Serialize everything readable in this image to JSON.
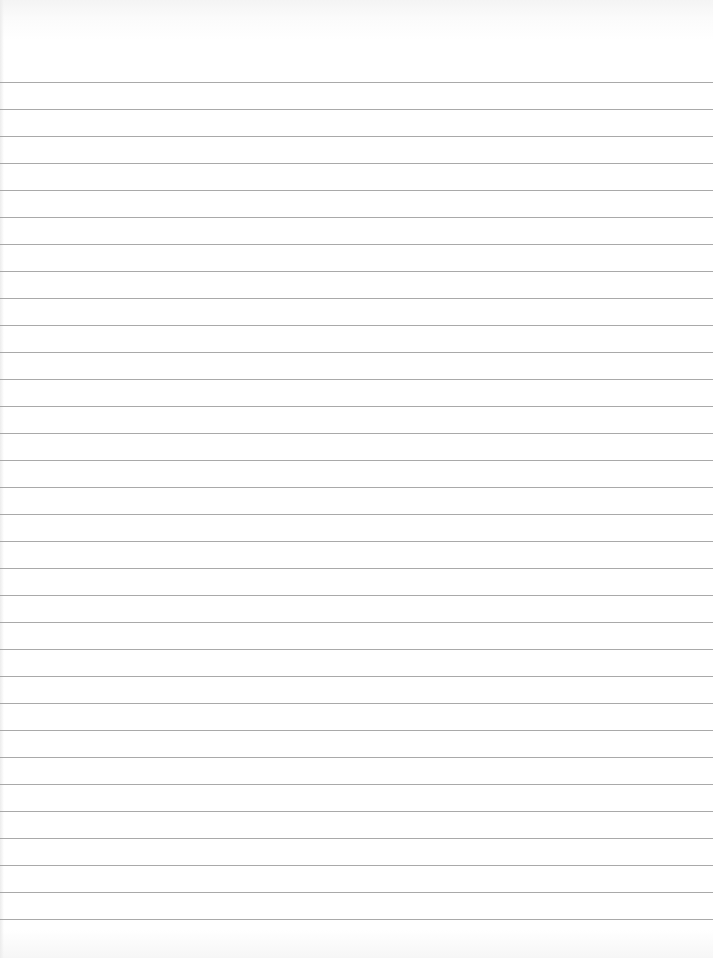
{
  "page": {
    "type": "lined-paper",
    "background_color": "#ffffff",
    "rule_color": "#9a9a9a",
    "rule_count": 32,
    "first_rule_y": 82,
    "rule_spacing": 27
  }
}
